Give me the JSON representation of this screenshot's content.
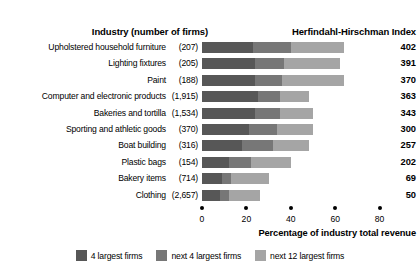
{
  "header": {
    "industry_header": "Industry (number of firms)",
    "hhi_header": "Herfindahl-Hirschman Index"
  },
  "axis": {
    "title": "Percentage of industry total revenue",
    "ticks": [
      "0",
      "20",
      "40",
      "60",
      "80"
    ]
  },
  "legend": {
    "items": [
      {
        "label": "4 largest firms",
        "color": "#575757",
        "swatch_name": "legend-swatch-4-largest"
      },
      {
        "label": "next 4 largest firms",
        "color": "#777777",
        "swatch_name": "legend-swatch-next-4"
      },
      {
        "label": "next 12 largest firms",
        "color": "#a5a5a5",
        "swatch_name": "legend-swatch-next-12"
      }
    ]
  },
  "colors": {
    "seg_4_largest": "#575757",
    "seg_next_4": "#777777",
    "seg_next_12": "#a5a5a5",
    "text": "#000000",
    "background": "#ffffff"
  },
  "chart_data": {
    "type": "bar",
    "orientation": "horizontal",
    "stacked": true,
    "xlabel": "Percentage of industry total revenue",
    "ylabel": "Industry (number of firms)",
    "xlim": [
      0,
      80
    ],
    "xticks": [
      0,
      20,
      40,
      60,
      80
    ],
    "grid": false,
    "legend_position": "bottom-center",
    "categories": [
      "Upholstered household furniture",
      "Lighting fixtures",
      "Paint",
      "Computer and electronic products",
      "Bakeries and tortilla",
      "Sporting and athletic goods",
      "Boat building",
      "Plastic bags",
      "Bakery items",
      "Clothing"
    ],
    "firm_counts": [
      "(207)",
      "(205)",
      "(188)",
      "(1,915)",
      "(1,534)",
      "(370)",
      "(316)",
      "(154)",
      "(714)",
      "(2,657)"
    ],
    "series": [
      {
        "name": "4 largest firms",
        "color": "#575757",
        "values": [
          23,
          24,
          24,
          25,
          24,
          21,
          18,
          12,
          9,
          8
        ]
      },
      {
        "name": "next 4 largest firms",
        "color": "#777777",
        "values": [
          17,
          13,
          12,
          10,
          11,
          13,
          14,
          10,
          4,
          4
        ]
      },
      {
        "name": "next 12 largest firms",
        "color": "#a5a5a5",
        "values": [
          24,
          25,
          28,
          13,
          15,
          16,
          16,
          18,
          17,
          14
        ]
      }
    ],
    "hhi_values": [
      402,
      391,
      370,
      363,
      343,
      300,
      257,
      202,
      69,
      50
    ],
    "rows": [
      {
        "industry": "Upholstered household furniture",
        "firms": "(207)",
        "seg_a": 23,
        "seg_b": 17,
        "seg_c": 24,
        "hhi": "402"
      },
      {
        "industry": "Lighting fixtures",
        "firms": "(205)",
        "seg_a": 24,
        "seg_b": 13,
        "seg_c": 25,
        "hhi": "391"
      },
      {
        "industry": "Paint",
        "firms": "(188)",
        "seg_a": 24,
        "seg_b": 12,
        "seg_c": 28,
        "hhi": "370"
      },
      {
        "industry": "Computer and electronic products",
        "firms": "(1,915)",
        "seg_a": 25,
        "seg_b": 10,
        "seg_c": 13,
        "hhi": "363"
      },
      {
        "industry": "Bakeries and tortilla",
        "firms": "(1,534)",
        "seg_a": 24,
        "seg_b": 11,
        "seg_c": 15,
        "hhi": "343"
      },
      {
        "industry": "Sporting and athletic goods",
        "firms": "(370)",
        "seg_a": 21,
        "seg_b": 13,
        "seg_c": 16,
        "hhi": "300"
      },
      {
        "industry": "Boat building",
        "firms": "(316)",
        "seg_a": 18,
        "seg_b": 14,
        "seg_c": 16,
        "hhi": "257"
      },
      {
        "industry": "Plastic bags",
        "firms": "(154)",
        "seg_a": 12,
        "seg_b": 10,
        "seg_c": 18,
        "hhi": "202"
      },
      {
        "industry": "Bakery items",
        "firms": "(714)",
        "seg_a": 9,
        "seg_b": 4,
        "seg_c": 17,
        "hhi": "69"
      },
      {
        "industry": "Clothing",
        "firms": "(2,657)",
        "seg_a": 8,
        "seg_b": 4,
        "seg_c": 14,
        "hhi": "50"
      }
    ]
  }
}
